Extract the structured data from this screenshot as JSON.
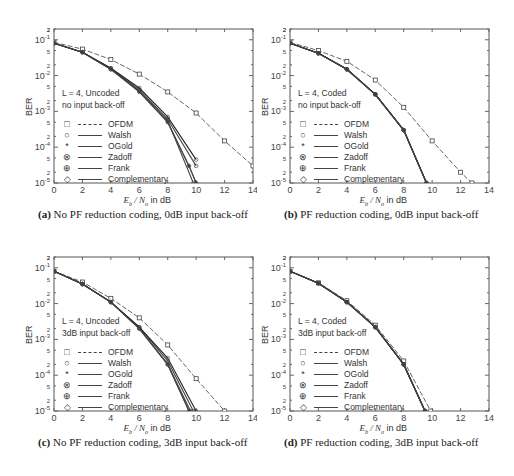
{
  "figure": {
    "panels": [
      {
        "id": "a",
        "caption_label": "(a)",
        "caption_text": " No PF reduction coding, 0dB input back-off",
        "annotation": [
          "L = 4, Uncoded",
          "no input back-off"
        ]
      },
      {
        "id": "b",
        "caption_label": "(b)",
        "caption_text": " PF reduction coding, 0dB input back-off",
        "annotation": [
          "L = 4, Coded",
          "no input back-off"
        ]
      },
      {
        "id": "c",
        "caption_label": "(c)",
        "caption_text": " No PF reduction coding, 3dB input back-off",
        "annotation": [
          "L = 4, Uncoded",
          "3dB input back-off"
        ]
      },
      {
        "id": "d",
        "caption_label": "(d)",
        "caption_text": " PF reduction coding, 3dB input back-off",
        "annotation": [
          "L = 4, Coded",
          "3dB input back-off"
        ]
      }
    ],
    "xlabel_sym": "E",
    "xlabel_sub": "b",
    "xlabel_mid": " / N",
    "xlabel_sub2": "o",
    "xlabel_tail": " in dB",
    "ylabel": "BER",
    "legend": [
      {
        "marker": "□",
        "label": "OFDM",
        "style": "dash"
      },
      {
        "marker": "○",
        "label": "Walsh",
        "style": "solid"
      },
      {
        "marker": "*",
        "label": "OGold",
        "style": "solid"
      },
      {
        "marker": "⊗",
        "label": "Zadoff",
        "style": "solid"
      },
      {
        "marker": "⊕",
        "label": "Frank",
        "style": "solid"
      },
      {
        "marker": "◇",
        "label": "Complementary",
        "style": "solid"
      }
    ]
  },
  "chart_data": [
    {
      "type": "line",
      "title": "(a) No PF reduction coding, 0dB input back-off",
      "xlabel": "Eb / No in dB",
      "ylabel": "BER",
      "yscale": "log",
      "xlim": [
        0,
        14
      ],
      "ylim": [
        1e-05,
        0.2
      ],
      "xticks": [
        0,
        2,
        4,
        6,
        8,
        10,
        12,
        14
      ],
      "yticks": [
        "10^-5",
        "10^-4",
        "10^-3",
        "10^-2",
        "10^-1"
      ],
      "series": [
        {
          "name": "OFDM",
          "x": [
            0,
            2,
            4,
            6,
            8,
            10,
            12,
            14
          ],
          "y": [
            0.085,
            0.055,
            0.028,
            0.011,
            0.0035,
            0.0009,
            0.00015,
            3e-05
          ]
        },
        {
          "name": "Walsh",
          "x": [
            0,
            2,
            4,
            6,
            8,
            9.5,
            10
          ],
          "y": [
            0.08,
            0.045,
            0.015,
            0.0035,
            0.0005,
            3e-05,
            1e-05
          ]
        },
        {
          "name": "OGold",
          "x": [
            0,
            2,
            4,
            6,
            8,
            9.5,
            10
          ],
          "y": [
            0.08,
            0.045,
            0.015,
            0.0035,
            0.0005,
            3e-05,
            1e-05
          ]
        },
        {
          "name": "Zadoff",
          "x": [
            0,
            2,
            4,
            6,
            8,
            10
          ],
          "y": [
            0.08,
            0.045,
            0.016,
            0.004,
            0.0006,
            3e-05
          ]
        },
        {
          "name": "Frank",
          "x": [
            0,
            2,
            4,
            6,
            8,
            10
          ],
          "y": [
            0.08,
            0.045,
            0.016,
            0.0045,
            0.0007,
            4.5e-05
          ]
        },
        {
          "name": "Complementary",
          "x": [
            0,
            2,
            4,
            6,
            8,
            9.8
          ],
          "y": [
            0.08,
            0.045,
            0.015,
            0.0038,
            0.00055,
            1e-05
          ]
        }
      ]
    },
    {
      "type": "line",
      "title": "(b) PF reduction coding, 0dB input back-off",
      "xlabel": "Eb / No in dB",
      "ylabel": "BER",
      "yscale": "log",
      "xlim": [
        0,
        14
      ],
      "ylim": [
        1e-05,
        0.2
      ],
      "xticks": [
        0,
        2,
        4,
        6,
        8,
        10,
        12,
        14
      ],
      "yticks": [
        "10^-5",
        "10^-4",
        "10^-3",
        "10^-2",
        "10^-1"
      ],
      "series": [
        {
          "name": "OFDM",
          "x": [
            0,
            2,
            4,
            6,
            8,
            10,
            12,
            12.8
          ],
          "y": [
            0.085,
            0.05,
            0.025,
            0.0075,
            0.0013,
            0.00015,
            2e-05,
            1e-05
          ]
        },
        {
          "name": "Walsh",
          "x": [
            0,
            2,
            4,
            6,
            8,
            9.6
          ],
          "y": [
            0.08,
            0.042,
            0.015,
            0.003,
            0.0003,
            1e-05
          ]
        },
        {
          "name": "OGold",
          "x": [
            0,
            2,
            4,
            6,
            8,
            9.6
          ],
          "y": [
            0.08,
            0.042,
            0.015,
            0.003,
            0.0003,
            1e-05
          ]
        },
        {
          "name": "Zadoff",
          "x": [
            0,
            2,
            4,
            6,
            8,
            9.6
          ],
          "y": [
            0.08,
            0.042,
            0.015,
            0.003,
            0.0003,
            1e-05
          ]
        },
        {
          "name": "Frank",
          "x": [
            0,
            2,
            4,
            6,
            8,
            9.6
          ],
          "y": [
            0.08,
            0.042,
            0.015,
            0.003,
            0.0003,
            1e-05
          ]
        },
        {
          "name": "Complementary",
          "x": [
            0,
            2,
            4,
            6,
            8,
            9.6
          ],
          "y": [
            0.08,
            0.042,
            0.015,
            0.003,
            0.0003,
            1e-05
          ]
        }
      ]
    },
    {
      "type": "line",
      "title": "(c) No PF reduction coding, 3dB input back-off",
      "xlabel": "Eb / No in dB",
      "ylabel": "BER",
      "yscale": "log",
      "xlim": [
        0,
        14
      ],
      "ylim": [
        1e-05,
        0.2
      ],
      "xticks": [
        0,
        2,
        4,
        6,
        8,
        10,
        12,
        14
      ],
      "yticks": [
        "10^-5",
        "10^-4",
        "10^-3",
        "10^-2",
        "10^-1"
      ],
      "series": [
        {
          "name": "OFDM",
          "x": [
            0,
            2,
            4,
            6,
            8,
            10,
            12
          ],
          "y": [
            0.08,
            0.04,
            0.014,
            0.004,
            0.0007,
            8e-05,
            1e-05
          ]
        },
        {
          "name": "Walsh",
          "x": [
            0,
            2,
            4,
            6,
            8,
            9.5
          ],
          "y": [
            0.08,
            0.035,
            0.011,
            0.002,
            0.0002,
            1e-05
          ]
        },
        {
          "name": "OGold",
          "x": [
            0,
            2,
            4,
            6,
            8,
            9.5
          ],
          "y": [
            0.08,
            0.035,
            0.011,
            0.002,
            0.0002,
            1e-05
          ]
        },
        {
          "name": "Zadoff",
          "x": [
            0,
            2,
            4,
            6,
            8,
            9.8
          ],
          "y": [
            0.08,
            0.035,
            0.011,
            0.0022,
            0.00025,
            1e-05
          ]
        },
        {
          "name": "Frank",
          "x": [
            0,
            2,
            4,
            6,
            8,
            10
          ],
          "y": [
            0.08,
            0.035,
            0.011,
            0.0022,
            0.0003,
            1e-05
          ]
        },
        {
          "name": "Complementary",
          "x": [
            0,
            2,
            4,
            6,
            8,
            9.6
          ],
          "y": [
            0.08,
            0.035,
            0.011,
            0.002,
            0.0002,
            1e-05
          ]
        }
      ]
    },
    {
      "type": "line",
      "title": "(d) PF reduction coding, 3dB input back-off",
      "xlabel": "Eb / No in dB",
      "ylabel": "BER",
      "yscale": "log",
      "xlim": [
        0,
        14
      ],
      "ylim": [
        1e-05,
        0.2
      ],
      "xticks": [
        0,
        2,
        4,
        6,
        8,
        10,
        12,
        14
      ],
      "yticks": [
        "10^-5",
        "10^-4",
        "10^-3",
        "10^-2",
        "10^-1"
      ],
      "series": [
        {
          "name": "OFDM",
          "x": [
            0,
            2,
            4,
            6,
            8,
            9.9
          ],
          "y": [
            0.08,
            0.038,
            0.012,
            0.0025,
            0.00025,
            1e-05
          ]
        },
        {
          "name": "Walsh",
          "x": [
            0,
            2,
            4,
            6,
            8,
            9.5
          ],
          "y": [
            0.08,
            0.037,
            0.011,
            0.0022,
            0.0002,
            1e-05
          ]
        },
        {
          "name": "OGold",
          "x": [
            0,
            2,
            4,
            6,
            8,
            9.5
          ],
          "y": [
            0.08,
            0.037,
            0.011,
            0.0022,
            0.0002,
            1e-05
          ]
        },
        {
          "name": "Zadoff",
          "x": [
            0,
            2,
            4,
            6,
            8,
            9.5
          ],
          "y": [
            0.08,
            0.037,
            0.011,
            0.0022,
            0.0002,
            1e-05
          ]
        },
        {
          "name": "Frank",
          "x": [
            0,
            2,
            4,
            6,
            8,
            9.5
          ],
          "y": [
            0.08,
            0.037,
            0.011,
            0.0022,
            0.0002,
            1e-05
          ]
        },
        {
          "name": "Complementary",
          "x": [
            0,
            2,
            4,
            6,
            8,
            9.5
          ],
          "y": [
            0.08,
            0.037,
            0.011,
            0.0022,
            0.0002,
            1e-05
          ]
        }
      ]
    }
  ]
}
